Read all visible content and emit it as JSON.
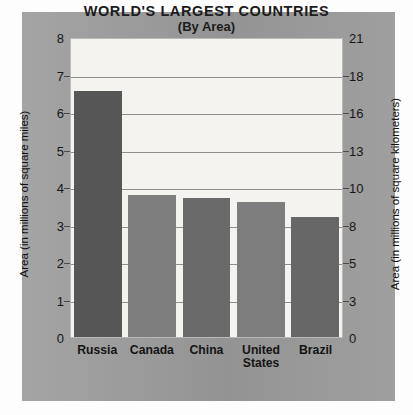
{
  "chart_data": {
    "type": "bar",
    "title": "WORLD'S LARGEST COUNTRIES",
    "subtitle": "(By Area)",
    "categories": [
      "Russia",
      "Canada",
      "China",
      "United States",
      "Brazil"
    ],
    "values": [
      6.55,
      3.8,
      3.7,
      3.6,
      3.2
    ],
    "series": [
      {
        "name": "Area (in millions of square miles)",
        "values": [
          6.55,
          3.8,
          3.7,
          3.6,
          3.2
        ]
      }
    ],
    "xlabel": "",
    "ylabel": "Area (in millions of square miles)",
    "ylabel_right": "Area (in millions of square kilometers)",
    "ylim": [
      0,
      8
    ],
    "ylim_right": [
      0,
      21
    ],
    "yticks": [
      8,
      7,
      6,
      5,
      4,
      3,
      2,
      1,
      0
    ],
    "yticks_right": [
      21,
      18,
      16,
      13,
      10,
      8,
      5,
      3,
      0
    ],
    "grid": true,
    "legend": "none",
    "bar_colors": [
      "#565656",
      "#7d7d7d",
      "#6a6a6a",
      "#7d7d7d",
      "#676767"
    ],
    "panel_color": "#9a9a9a",
    "plot_background": "#f4f3ef",
    "gridline_color": "#8e8e8a",
    "text_color": "#171717"
  },
  "axes": {
    "left": {
      "title": "Area (in millions of square miles)",
      "ticks": [
        "8",
        "7",
        "6",
        "5",
        "4",
        "3",
        "2",
        "1",
        "0"
      ]
    },
    "right": {
      "title": "Area (in millions of square kilometers)",
      "ticks": [
        "21",
        "18",
        "16",
        "13",
        "10",
        "8",
        "5",
        "3",
        "0"
      ]
    }
  },
  "title": {
    "line1": "WORLD'S LARGEST COUNTRIES",
    "line2": "(By Area)"
  },
  "categories": [
    {
      "label": "Russia"
    },
    {
      "label": "Canada"
    },
    {
      "label": "China"
    },
    {
      "label": "United States"
    },
    {
      "label": "Brazil"
    }
  ]
}
